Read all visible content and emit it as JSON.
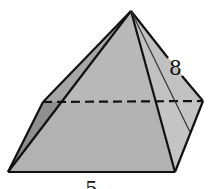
{
  "figure": {
    "type": "square-pyramid",
    "labels": {
      "slant_height": "8",
      "base_edge": "5"
    },
    "colors": {
      "face_front": "#b4b4b4",
      "face_left": "#8c8c8c",
      "face_right": "#c6c6c6",
      "edge": "#111111",
      "background": "#ffffff"
    },
    "vertices": {
      "apex": [
        131,
        11
      ],
      "back_left": [
        43,
        102
      ],
      "back_right": [
        203,
        101
      ],
      "front_left": [
        8,
        172
      ],
      "front_right": [
        175,
        172
      ]
    }
  }
}
